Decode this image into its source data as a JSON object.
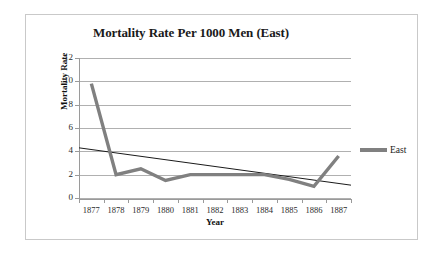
{
  "chart_data": {
    "type": "line",
    "title": "Mortality Rate Per 1000 Men (East)",
    "xlabel": "Year",
    "ylabel": "Mortality Rate",
    "categories": [
      "1877",
      "1878",
      "1879",
      "1880",
      "1881",
      "1882",
      "1883",
      "1884",
      "1885",
      "1886",
      "1887"
    ],
    "series": [
      {
        "name": "East",
        "color": "#808080",
        "values": [
          9.8,
          2.0,
          2.5,
          1.5,
          2.0,
          2.0,
          2.0,
          2.0,
          1.6,
          1.0,
          3.6
        ]
      }
    ],
    "trendline": {
      "name": "Linear trend",
      "color": "#1a1a1a",
      "start_value": 4.3,
      "end_value": 1.1
    },
    "ylim": [
      0,
      12
    ],
    "yticks": [
      0,
      2,
      4,
      6,
      8,
      10,
      12
    ],
    "ytick_labels": [
      "0",
      "2",
      "4",
      "6",
      "8",
      "10",
      "12"
    ],
    "grid": true,
    "legend_position": "right",
    "legend_entries": [
      "East"
    ]
  },
  "colors": {
    "series_gray": "#808080",
    "trendline": "#1a1a1a",
    "gridline": "#b0b0b0",
    "axis": "#9a9a9a",
    "frame_border": "#c9c9c9",
    "background": "#ffffff",
    "text": "#1a1a1a"
  }
}
